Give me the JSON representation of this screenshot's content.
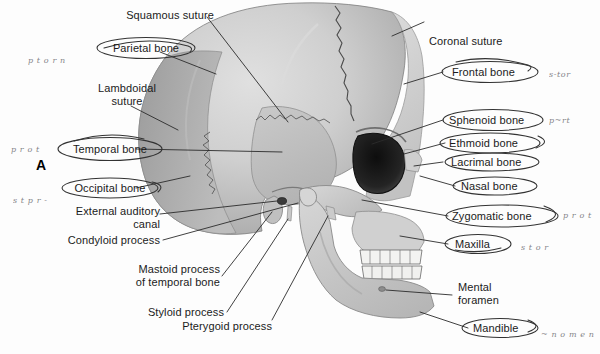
{
  "figure": {
    "panel_letter": "A"
  },
  "labels": {
    "squamous_suture": "Squamous suture",
    "parietal_bone": "Parietal bone",
    "lambdoidal_suture": "Lambdoidal\nsuture",
    "temporal_bone": "Temporal bone",
    "occipital_bone": "Occipital bone",
    "external_auditory_canal": "External auditory\ncanal",
    "condyloid_process": "Condyloid process",
    "mastoid_process": "Mastoid process\nof temporal bone",
    "styloid_process": "Styloid process",
    "pterygoid_process": "Pterygoid process",
    "coronal_suture": "Coronal suture",
    "frontal_bone": "Frontal bone",
    "sphenoid_bone": "Sphenoid bone",
    "ethmoid_bone": "Ethmoid bone",
    "lacrimal_bone": "Lacrimal bone",
    "nasal_bone": "Nasal bone",
    "zygomatic_bone": "Zygomatic bone",
    "maxilla": "Maxilla",
    "mental_foramen": "Mental\nforamen",
    "mandible": "Mandible"
  },
  "handwriting": {
    "left_top": "p t o r n",
    "left_mid": "p r o t",
    "left_low": "s t p r -",
    "right_frontal": "s-tor",
    "right_sphenoid": "p~rt",
    "right_zygomatic": "p r o t",
    "right_maxilla": "s t o r",
    "right_mandible": "~ n o m e n"
  },
  "colors": {
    "background": "#fdfdfd",
    "label_text": "#1b1b1b",
    "leader_line": "#2b2b2b",
    "ink_circle": "#333333",
    "handwriting": "#6e6e73",
    "cranium_light": "#cccccc",
    "cranium_mid": "#bdbdbd",
    "occipital_dark": "#a8a8a8",
    "temporal_plate": "#c2c2c2",
    "face_bone": "#d2d2d2",
    "mandible": "#c6c6c6",
    "teeth": "#f4f4f2",
    "orbit_dark": "#1a1a1a",
    "suture_line": "#4a4a4a"
  }
}
